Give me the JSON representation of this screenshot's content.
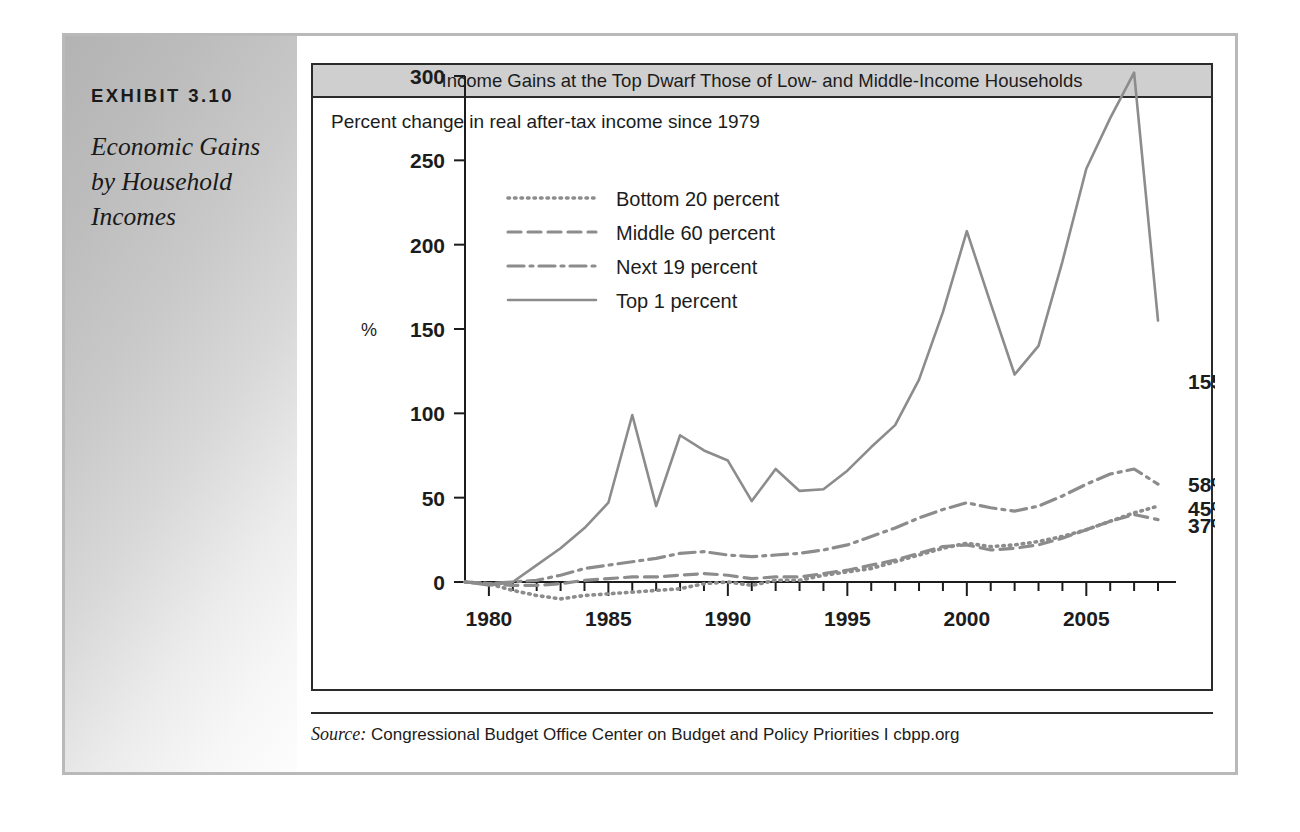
{
  "exhibit": {
    "number_label": "EXHIBIT 3.10",
    "title": "Economic Gains by Household Incomes"
  },
  "chart_header": {
    "banner_title": "Income Gains at the Top Dwarf Those of Low- and Middle-Income Households",
    "subtitle": "Percent change in real after-tax income since 1979"
  },
  "source": {
    "label": "Source:",
    "text": "Congressional Budget Office Center on Budget and Policy Priorities I cbpp.org"
  },
  "colors": {
    "line_gray": "#8c8c8c",
    "axis_black": "#1c1c1c",
    "banner_gray": "#cfcfcf",
    "panel_gray": "#c2c2c2",
    "frame_gray": "#b9b9b9"
  },
  "end_labels": [
    {
      "name": "top-1-percent",
      "value": "155%"
    },
    {
      "name": "next-19-percent",
      "value": "58%"
    },
    {
      "name": "bottom-20-percent",
      "value": "45%"
    },
    {
      "name": "middle-60-percent",
      "value": "37%"
    }
  ],
  "chart_data": {
    "type": "line",
    "title": "Income Gains at the Top Dwarf Those of Low- and Middle-Income Households",
    "subtitle": "Percent change in real after-tax income since 1979",
    "xlabel": "",
    "ylabel": "%",
    "ylim": [
      0,
      300
    ],
    "yticks": [
      0,
      50,
      100,
      150,
      200,
      250,
      300
    ],
    "ytick_labels": [
      "0",
      "50",
      "100",
      "150",
      "200",
      "250",
      "300"
    ],
    "xlim": [
      1979,
      2008
    ],
    "xticks": [
      1980,
      1985,
      1990,
      1995,
      2000,
      2005
    ],
    "xtick_labels": [
      "1980",
      "1985",
      "1990",
      "1995",
      "2000",
      "2005"
    ],
    "x_minor_tick_step": 1,
    "grid": false,
    "legend_position": "upper-left-inside",
    "x": [
      1979,
      1980,
      1981,
      1982,
      1983,
      1984,
      1985,
      1986,
      1987,
      1988,
      1989,
      1990,
      1991,
      1992,
      1993,
      1994,
      1995,
      1996,
      1997,
      1998,
      1999,
      2000,
      2001,
      2002,
      2003,
      2004,
      2005,
      2006,
      2007,
      2008
    ],
    "series": [
      {
        "name": "Bottom 20 percent",
        "line_style": "dotted",
        "end_value": 45,
        "values": [
          0,
          -1,
          -5,
          -8,
          -10,
          -8,
          -7,
          -6,
          -5,
          -4,
          -1,
          0,
          -2,
          1,
          1,
          4,
          6,
          8,
          12,
          16,
          20,
          23,
          21,
          22,
          24,
          27,
          31,
          36,
          41,
          45
        ]
      },
      {
        "name": "Middle 60 percent",
        "line_style": "dashed",
        "end_value": 37,
        "values": [
          0,
          -1,
          -2,
          -2,
          -1,
          1,
          2,
          3,
          3,
          4,
          5,
          4,
          2,
          3,
          3,
          5,
          7,
          10,
          13,
          17,
          21,
          22,
          19,
          20,
          22,
          26,
          31,
          36,
          40,
          37
        ]
      },
      {
        "name": "Next 19 percent",
        "line_style": "dash-dot",
        "end_value": 58,
        "values": [
          0,
          -1,
          0,
          1,
          4,
          8,
          10,
          12,
          14,
          17,
          18,
          16,
          15,
          16,
          17,
          19,
          22,
          27,
          32,
          38,
          43,
          47,
          44,
          42,
          45,
          51,
          58,
          64,
          67,
          58
        ]
      },
      {
        "name": "Top 1 percent",
        "line_style": "solid",
        "end_value": 155,
        "values": [
          0,
          -2,
          0,
          10,
          20,
          32,
          47,
          99,
          45,
          87,
          78,
          72,
          48,
          67,
          54,
          55,
          66,
          80,
          93,
          120,
          160,
          208,
          165,
          123,
          140,
          190,
          245,
          275,
          302,
          155
        ]
      }
    ]
  }
}
